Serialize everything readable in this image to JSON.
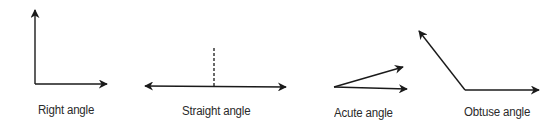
{
  "diagram": {
    "stroke_color": "#1a1a1a",
    "label_color": "#2a2a2a",
    "angles": [
      {
        "name": "right",
        "label": "Right angle"
      },
      {
        "name": "straight",
        "label": "Straight angle"
      },
      {
        "name": "acute",
        "label": "Acute angle"
      },
      {
        "name": "obtuse",
        "label": "Obtuse angle"
      }
    ]
  }
}
